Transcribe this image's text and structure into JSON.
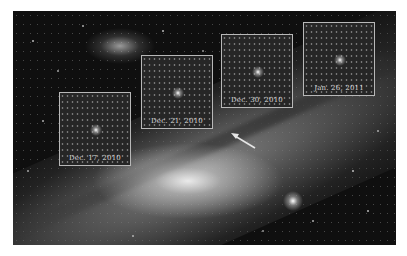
{
  "image": {
    "description": "Andromeda galaxy with four inset panels showing a brightening point source over time",
    "background_color": "#ffffff",
    "insets": [
      {
        "label": "Dec. 17, 2010"
      },
      {
        "label": "Dec. 21, 2010"
      },
      {
        "label": "Dec. 30, 2010"
      },
      {
        "label": "Jan. 26, 2011"
      }
    ],
    "arrow": {
      "direction": "up-left",
      "color": "#e6e6e6"
    }
  }
}
